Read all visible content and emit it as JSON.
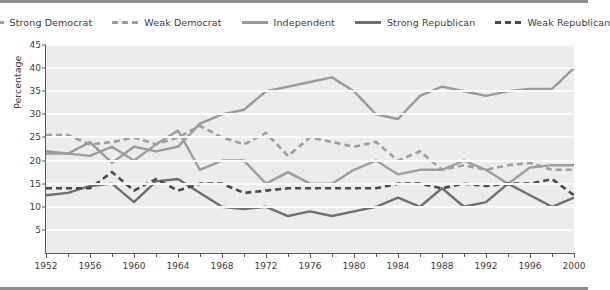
{
  "chart_data": {
    "type": "line",
    "title": "",
    "xlabel": "",
    "ylabel": "Percentage",
    "xlim": [
      1952,
      2000
    ],
    "ylim": [
      0,
      45
    ],
    "yticks": [
      5,
      10,
      15,
      20,
      25,
      30,
      35,
      40,
      45
    ],
    "xticks": [
      1952,
      1956,
      1960,
      1964,
      1968,
      1972,
      1976,
      1980,
      1984,
      1988,
      1992,
      1996,
      2000
    ],
    "xticks_minor": [
      1954,
      1958,
      1962,
      1966,
      1970,
      1974,
      1978,
      1982,
      1986,
      1990,
      1994,
      1998
    ],
    "x": [
      1952,
      1954,
      1956,
      1958,
      1960,
      1962,
      1964,
      1966,
      1968,
      1970,
      1972,
      1974,
      1976,
      1978,
      1980,
      1982,
      1984,
      1986,
      1988,
      1990,
      1992,
      1994,
      1996,
      1998,
      2000
    ],
    "grid": "horizontal",
    "legend_position": "top-center",
    "plot_background": "#ececec",
    "series": [
      {
        "name": "Strong Democrat",
        "color": "#9e9e9e",
        "style": "solid",
        "values": [
          21.5,
          21.5,
          21.0,
          23.0,
          20.0,
          23.5,
          26.5,
          18.0,
          20.0,
          20.0,
          15.0,
          17.5,
          15.0,
          15.0,
          18.0,
          20.0,
          17.0,
          18.0,
          18.0,
          20.0,
          18.0,
          15.0,
          18.5,
          19.0,
          19.0
        ]
      },
      {
        "name": "Weak Democrat",
        "color": "#9e9e9e",
        "style": "dashed",
        "values": [
          25.5,
          25.5,
          23.5,
          24.0,
          25.0,
          23.5,
          25.0,
          27.5,
          25.0,
          23.5,
          26.0,
          21.0,
          25.0,
          24.0,
          23.0,
          24.0,
          20.0,
          22.0,
          18.0,
          19.0,
          18.0,
          19.0,
          19.5,
          18.0,
          18.0
        ]
      },
      {
        "name": "Independent",
        "color": "#9a9a9a",
        "style": "solid",
        "values": [
          22.0,
          21.5,
          24.0,
          19.5,
          23.0,
          22.0,
          23.0,
          28.0,
          30.0,
          31.0,
          35.0,
          36.0,
          37.0,
          38.0,
          35.0,
          30.0,
          29.0,
          34.0,
          36.0,
          35.0,
          34.0,
          35.0,
          35.5,
          35.5,
          40.0
        ]
      },
      {
        "name": "Strong Republican",
        "color": "#6f6f6f",
        "style": "solid",
        "values": [
          12.5,
          13.0,
          14.5,
          15.0,
          11.0,
          15.5,
          16.0,
          13.0,
          10.0,
          9.5,
          10.0,
          8.0,
          9.0,
          8.0,
          9.0,
          10.0,
          12.0,
          10.0,
          14.0,
          10.0,
          11.0,
          15.0,
          12.5,
          10.0,
          12.0
        ]
      },
      {
        "name": "Weak Republican",
        "color": "#4a4a4a",
        "style": "dashed",
        "values": [
          14.0,
          14.0,
          14.0,
          17.5,
          13.5,
          16.0,
          13.5,
          15.0,
          15.0,
          13.0,
          13.5,
          14.0,
          14.0,
          14.0,
          14.0,
          14.0,
          15.0,
          15.0,
          14.0,
          15.0,
          14.5,
          15.0,
          15.0,
          16.0,
          12.5
        ]
      }
    ]
  },
  "legend": {
    "items": [
      {
        "label": "Strong Democrat"
      },
      {
        "label": "Weak Democrat"
      },
      {
        "label": "Independent"
      },
      {
        "label": "Strong Republican"
      },
      {
        "label": "Weak Republican"
      }
    ]
  }
}
